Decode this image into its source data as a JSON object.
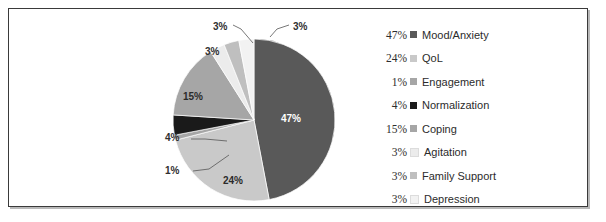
{
  "figure": {
    "background": "#ffffff",
    "frame_color": "#3a3a3a"
  },
  "chart_data": {
    "type": "pie",
    "title": "",
    "categories": [
      "Mood/Anxiety",
      "QoL",
      "Engagement",
      "Normalization",
      "Coping",
      "Agitation",
      "Family Support",
      "Depression"
    ],
    "values": [
      47,
      24,
      1,
      4,
      15,
      3,
      3,
      3
    ],
    "value_unit": "%",
    "data_labels": [
      "47%",
      "24%",
      "1%",
      "4%",
      "15%",
      "3%",
      "3%",
      "3%"
    ],
    "colors": [
      "#595959",
      "#c9c9c9",
      "#a6a6a6",
      "#1a1a1a",
      "#a6a6a6",
      "#ececec",
      "#bfbfbf",
      "#f2f2f2"
    ],
    "start_angle_deg": 0,
    "direction": "clockwise",
    "legend_position": "right",
    "grid": false,
    "xlabel": "",
    "ylabel": ""
  },
  "pie_labels": [
    {
      "text": "47%",
      "inside": true
    },
    {
      "text": "24%",
      "inside": true
    },
    {
      "text": "1%",
      "inside": false
    },
    {
      "text": "4%",
      "inside": false
    },
    {
      "text": "15%",
      "inside": true
    },
    {
      "text": "3%",
      "inside": false
    },
    {
      "text": "3%",
      "inside": false
    },
    {
      "text": "3%",
      "inside": false
    }
  ],
  "legend": {
    "rows": [
      {
        "pct": "47%",
        "label": "Mood/Anxiety",
        "color": "#595959"
      },
      {
        "pct": "24%",
        "label": "QoL",
        "color": "#c9c9c9"
      },
      {
        "pct": "1%",
        "label": "Engagement",
        "color": "#a6a6a6"
      },
      {
        "pct": "4%",
        "label": "Normalization",
        "color": "#1a1a1a"
      },
      {
        "pct": "15%",
        "label": "Coping",
        "color": "#a6a6a6"
      },
      {
        "pct": "3%",
        "label": "Agitation",
        "color": "#ececec"
      },
      {
        "pct": "3%",
        "label": "Family Support",
        "color": "#bfbfbf"
      },
      {
        "pct": "3%",
        "label": "Depression",
        "color": "#f2f2f2"
      }
    ]
  }
}
